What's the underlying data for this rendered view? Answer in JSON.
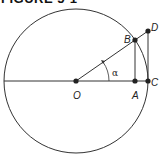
{
  "figure": {
    "title": "FIGURE 5-1",
    "type": "unit-circle trigonometry diagram",
    "colors": {
      "stroke": "#333333",
      "point": "#222222",
      "background": "#ffffff"
    },
    "circle": {
      "center": "O",
      "cx": 76,
      "cy": 81,
      "r": 72
    },
    "points": [
      {
        "id": "O",
        "label": "O",
        "x": 76,
        "y": 81
      },
      {
        "id": "A",
        "label": "A",
        "x": 135,
        "y": 81
      },
      {
        "id": "C",
        "label": "C",
        "x": 148,
        "y": 81
      },
      {
        "id": "B",
        "label": "B",
        "x": 135,
        "y": 40
      },
      {
        "id": "D",
        "label": "D",
        "x": 148,
        "y": 31
      }
    ],
    "segments": [
      [
        "diameter-left",
        "C"
      ],
      [
        "O",
        "D"
      ],
      [
        "B",
        "A"
      ],
      [
        "D",
        "C"
      ]
    ],
    "angle": {
      "label": "α",
      "vertex": "O",
      "from": "OC",
      "to": "OB"
    }
  }
}
